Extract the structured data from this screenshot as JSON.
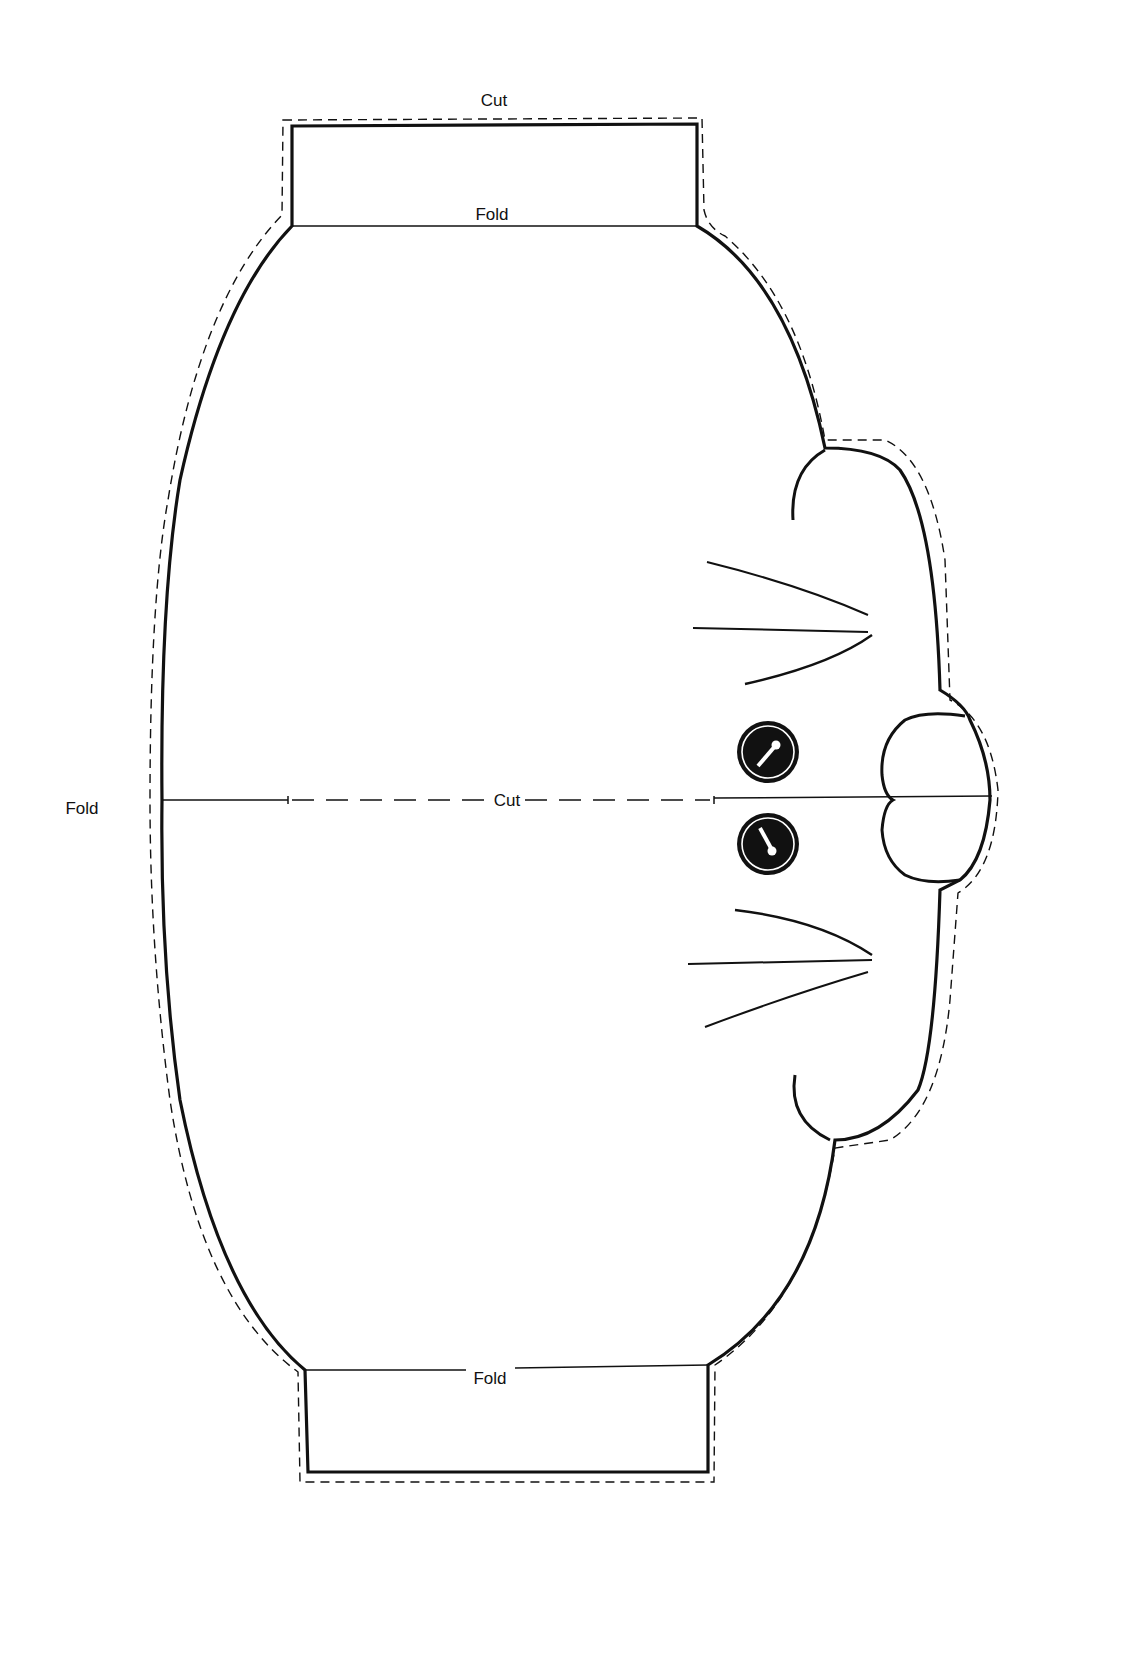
{
  "pattern": {
    "title": "Cat face paper-craft template",
    "labels": {
      "top_cut": "Cut",
      "top_fold": "Fold",
      "center_cut": "Cut",
      "left_fold": "Fold",
      "bottom_fold": "Fold"
    },
    "legend": {
      "solid_line": "outline",
      "dashed_line": "cut line"
    },
    "features": [
      "left-ear",
      "right-ear",
      "upper-whiskers",
      "lower-whiskers",
      "upper-eye",
      "lower-eye",
      "nose"
    ],
    "colors": {
      "ink": "#111111",
      "paper": "#ffffff"
    }
  }
}
